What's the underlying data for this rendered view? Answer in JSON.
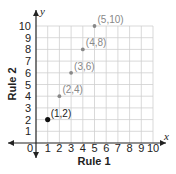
{
  "chart_data": {
    "type": "scatter",
    "title": "",
    "xlabel": "Rule 1",
    "ylabel": "Rule 2",
    "x_axis_name": "x",
    "y_axis_name": "y",
    "xlim": [
      0,
      10
    ],
    "ylim": [
      0,
      10
    ],
    "grid": true,
    "origin_label": "0",
    "x_ticks": [
      "1",
      "2",
      "3",
      "4",
      "5",
      "6",
      "7",
      "8",
      "9",
      "10"
    ],
    "y_ticks": [
      "1",
      "2",
      "3",
      "4",
      "5",
      "6",
      "7",
      "8",
      "9",
      "10"
    ],
    "series": [
      {
        "name": "points",
        "points": [
          {
            "x": 1,
            "y": 2,
            "label": "(1,2)",
            "color": "#111111"
          },
          {
            "x": 2,
            "y": 4,
            "label": "(2,4)",
            "color": "#888888"
          },
          {
            "x": 3,
            "y": 6,
            "label": "(3,6)",
            "color": "#888888"
          },
          {
            "x": 4,
            "y": 8,
            "label": "(4,8)",
            "color": "#888888"
          },
          {
            "x": 5,
            "y": 10,
            "label": "(5,10)",
            "color": "#888888"
          }
        ]
      }
    ]
  }
}
